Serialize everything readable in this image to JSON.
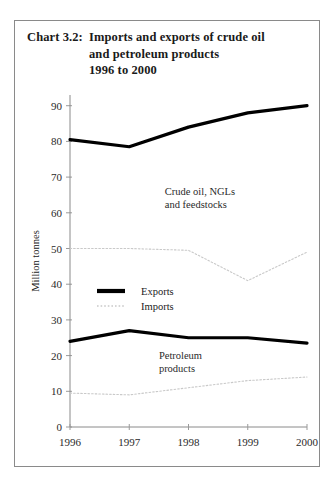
{
  "chart_data": {
    "type": "line",
    "title_label": "Chart 3.2:",
    "title_line1": "Imports and exports of crude oil",
    "title_line2": "and petroleum products",
    "title_line3": "1996 to 2000",
    "xlabel": "",
    "ylabel": "Million tonnes",
    "categories": [
      "1996",
      "1997",
      "1998",
      "1999",
      "2000"
    ],
    "x": [
      1996,
      1997,
      1998,
      1999,
      2000
    ],
    "ylim": [
      0,
      93
    ],
    "yticks": [
      0,
      10,
      20,
      30,
      40,
      50,
      60,
      70,
      80,
      90
    ],
    "ytick_labels": [
      "0",
      "10",
      "20",
      "30",
      "40",
      "50",
      "60",
      "70",
      "80",
      "90"
    ],
    "grid": false,
    "legend_position": "center-left",
    "series": [
      {
        "name": "Exports",
        "group": "Crude oil, NGLs and feedstocks",
        "style": "solid-thick",
        "color": "#000000",
        "values": [
          80.5,
          78.5,
          84.0,
          88.0,
          90.0
        ]
      },
      {
        "name": "Imports",
        "group": "Crude oil, NGLs and feedstocks",
        "style": "dotted",
        "color": "#c9c9c9",
        "values": [
          50.0,
          50.0,
          49.5,
          41.0,
          49.0
        ]
      },
      {
        "name": "Exports",
        "group": "Petroleum products",
        "style": "solid-thick",
        "color": "#000000",
        "values": [
          24.0,
          27.0,
          25.0,
          25.0,
          23.5
        ]
      },
      {
        "name": "Imports",
        "group": "Petroleum products",
        "style": "dotted",
        "color": "#c9c9c9",
        "values": [
          9.5,
          9.0,
          11.0,
          13.0,
          14.0
        ]
      }
    ],
    "annotations": [
      {
        "text_line1": "Crude oil, NGLs",
        "text_line2": "and feedstocks",
        "x": 1997.6,
        "y": 65
      },
      {
        "text_line1": "Petroleum",
        "text_line2": "products",
        "x": 1997.5,
        "y": 19
      }
    ],
    "legend": [
      {
        "label": "Exports",
        "style": "solid-thick",
        "color": "#000000"
      },
      {
        "label": "Imports",
        "style": "dotted",
        "color": "#c9c9c9"
      }
    ]
  }
}
